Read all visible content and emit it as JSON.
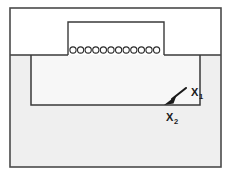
{
  "figure": {
    "canvas": {
      "width": 231,
      "height": 174,
      "background": "#ffffff"
    },
    "colors": {
      "stroke": "#3a3a3a",
      "stroke_light": "#8a8a8a",
      "upper_region_fill": "#ffffff",
      "lower_region_fill": "#efefef",
      "inner_region_fill": "#f7f7f7",
      "text": "#1a1a1a"
    },
    "outer_frame": {
      "name": "outer-frame",
      "x": 10,
      "y": 8,
      "width": 211,
      "height": 159,
      "stroke_width": 1.6
    },
    "upper_region": {
      "name": "upper-white-region",
      "x": 10,
      "y": 8,
      "width": 211,
      "height": 47,
      "fill": "#ffffff"
    },
    "lower_region": {
      "name": "lower-gray-region",
      "x": 10,
      "y": 55,
      "width": 211,
      "height": 112,
      "fill": "#efefef"
    },
    "divider_line": {
      "name": "region-divider-line",
      "x1": 10,
      "y1": 55,
      "x2": 221,
      "y2": 55
    },
    "protruding_box": {
      "name": "protruding-gate-box",
      "x": 68,
      "y": 22,
      "width": 96,
      "height": 33,
      "fill": "#ffffff"
    },
    "inner_trench": {
      "name": "inner-trench-rectangle",
      "x": 31,
      "y": 55,
      "width": 169,
      "height": 50,
      "fill": "#f7f7f7"
    },
    "circle_row": {
      "name": "circle-row",
      "count": 12,
      "start_x": 73,
      "spacing": 7.6,
      "center_y": 50,
      "radius": 3.1,
      "glyph": "circle-outline"
    },
    "arrow": {
      "name": "pointer-arrow",
      "tail_x": 186,
      "tail_y": 88,
      "head_x": 166,
      "head_y": 104,
      "direction": "down-left"
    },
    "labels": [
      {
        "name": "label-x1",
        "base": "X",
        "subscript": "1",
        "x": 191,
        "y": 96
      },
      {
        "name": "label-x2",
        "base": "X",
        "subscript": "2",
        "x": 166,
        "y": 121
      }
    ]
  }
}
